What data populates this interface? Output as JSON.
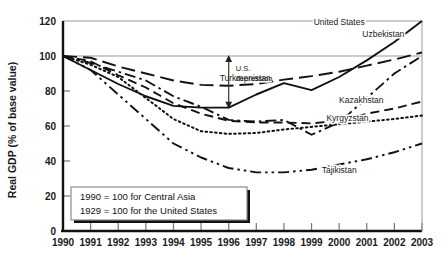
{
  "chart_data": {
    "type": "line",
    "title": "",
    "xlabel": "",
    "ylabel": "Real GDP (% of base value)",
    "xlim": [
      1990,
      2003
    ],
    "ylim": [
      0,
      120
    ],
    "yticks": [
      0,
      20,
      40,
      60,
      80,
      100,
      120
    ],
    "xticks": [
      1990,
      1991,
      1992,
      1993,
      1994,
      1995,
      1996,
      1997,
      1998,
      1999,
      2000,
      2001,
      2002,
      2003
    ],
    "grid": "horizontal-gridlines-at-100-and-120",
    "legend_position": "inline-labels-on-series",
    "x": [
      1990,
      1991,
      1992,
      1993,
      1994,
      1995,
      1996,
      1997,
      1998,
      1999,
      2000,
      2001,
      2002,
      2003
    ],
    "series": [
      {
        "name": "United States",
        "label": "United States",
        "style": "solid",
        "label_x": 2000.0,
        "label_y": 118,
        "values": [
          100,
          92,
          84,
          77,
          71.5,
          70.5,
          70.5,
          78,
          84.5,
          80.5,
          88,
          97.5,
          108,
          120
        ]
      },
      {
        "name": "Uzbekistan",
        "label": "Uzbekistan",
        "style": "longdash",
        "label_x": 2001.6,
        "label_y": 111,
        "values": [
          100,
          99,
          94,
          90,
          86,
          83.5,
          83,
          84,
          86.5,
          88.5,
          91,
          94.5,
          98,
          102
        ]
      },
      {
        "name": "Turkmenistan",
        "label": "Turkmenistan",
        "style": "dashdot",
        "label_x": 1996.6,
        "label_y": 86,
        "values": [
          100,
          96,
          91,
          86,
          77,
          71,
          63.5,
          62.5,
          63.5,
          55,
          62,
          76,
          90,
          100
        ]
      },
      {
        "name": "Kazakhstan",
        "label": "Kazakhstan",
        "style": "dash",
        "label_x": 2000.8,
        "label_y": 73,
        "values": [
          100,
          97,
          89,
          82,
          73,
          67,
          63,
          62,
          62,
          61.5,
          63,
          67,
          70,
          74
        ]
      },
      {
        "name": "Kyrgyzstan",
        "label": "Kyrgyzstan",
        "style": "dotted",
        "label_x": 2000.3,
        "label_y": 63,
        "values": [
          100,
          95,
          88,
          76,
          64,
          57,
          55.5,
          56,
          58,
          59.5,
          61,
          62.5,
          64,
          66
        ]
      },
      {
        "name": "Tajikistan",
        "label": "Tajikistan",
        "style": "dashdotdot",
        "label_x": 2000.0,
        "label_y": 33,
        "values": [
          100,
          92,
          78,
          64,
          50,
          42,
          36,
          33.5,
          33.5,
          35,
          38,
          41,
          45,
          50
        ]
      }
    ],
    "annotations": [
      {
        "name": "us-depression",
        "text_line1": "U.S.",
        "text_line2": "depression",
        "x": 1996,
        "y_top": 100,
        "y_bottom": 70.5,
        "kind": "double-arrow-vertical"
      }
    ],
    "note_box": {
      "line1": "1990 = 100 for Central Asia",
      "line2": "1929 = 100 for the United States"
    }
  },
  "colors": {
    "line": "#111111",
    "axis": "#111111",
    "gridline": "#9a9a9a",
    "text": "#1a1a1a",
    "background": "#ffffff",
    "note_box_border": "#808080",
    "note_box_shadow": "#111111"
  }
}
